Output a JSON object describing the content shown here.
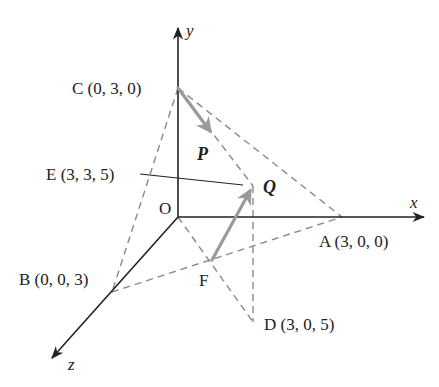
{
  "axes": {
    "x_label": "x",
    "y_label": "y",
    "z_label": "z"
  },
  "points": {
    "O": {
      "label": "O"
    },
    "A": {
      "label": "A (3, 0, 0)"
    },
    "B": {
      "label": "B (0, 0, 3)"
    },
    "C": {
      "label": "C (0, 3, 0)"
    },
    "D": {
      "label": "D (3, 0, 5)"
    },
    "E": {
      "label": "E (3, 3, 5)"
    },
    "F": {
      "label": "F"
    }
  },
  "vectors": {
    "P": {
      "label": "P"
    },
    "Q": {
      "label": "Q"
    }
  },
  "colors": {
    "axis": "#222222",
    "dashed": "#8a8a8a",
    "vector": "#9a9a9a"
  }
}
